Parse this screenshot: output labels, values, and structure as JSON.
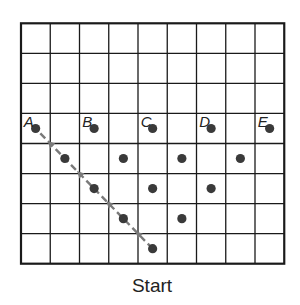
{
  "caption": "Start",
  "grid": {
    "cols": 9,
    "rows": 8,
    "x0": 21,
    "y0": 23.3,
    "cell_w": 29.25,
    "cell_h": 30.05,
    "line_color": "#1a1a1a",
    "border_width": 2.2,
    "line_width": 1.3
  },
  "dot_color": "#3a3a3a",
  "dot_radius": 4.6,
  "path_color": "#7a7a7a",
  "labeled_points": [
    {
      "label": "A",
      "col": 0,
      "row": 3
    },
    {
      "label": "B",
      "col": 2,
      "row": 3
    },
    {
      "label": "C",
      "col": 4,
      "row": 3
    },
    {
      "label": "D",
      "col": 6,
      "row": 3
    },
    {
      "label": "E",
      "col": 8,
      "row": 3
    }
  ],
  "points": [
    {
      "col": 1,
      "row": 4
    },
    {
      "col": 3,
      "row": 4
    },
    {
      "col": 5,
      "row": 4
    },
    {
      "col": 7,
      "row": 4
    },
    {
      "col": 2,
      "row": 5
    },
    {
      "col": 4,
      "row": 5
    },
    {
      "col": 6,
      "row": 5
    },
    {
      "col": 3,
      "row": 6
    },
    {
      "col": 5,
      "row": 6
    },
    {
      "col": 4,
      "row": 7
    }
  ],
  "path": {
    "from": {
      "col": 4,
      "row": 7
    },
    "to": {
      "col": 0,
      "row": 3
    },
    "style": "dashed",
    "arrow_direction": "toward-A"
  }
}
